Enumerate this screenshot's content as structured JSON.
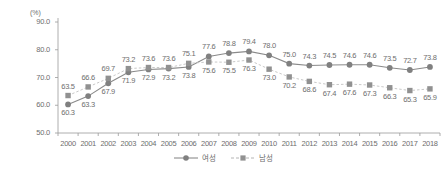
{
  "chart_data": {
    "type": "line",
    "title": "",
    "subtitle": "",
    "xlabel": "",
    "ylabel": "",
    "unit_label": "(%)",
    "ylim": [
      50.0,
      90.0
    ],
    "yticks": [
      "90.0",
      "80.0",
      "70.0",
      "60.0",
      "50.0"
    ],
    "grid": false,
    "legend_position": "bottom-center",
    "categories": [
      "2000",
      "2001",
      "2002",
      "2003",
      "2004",
      "2005",
      "2006",
      "2007",
      "2008",
      "2009",
      "2010",
      "2011",
      "2012",
      "2013",
      "2014",
      "2015",
      "2016",
      "2017",
      "2018"
    ],
    "series": [
      {
        "name": "여성",
        "marker": "circle",
        "line_style": "solid",
        "color": "#808080",
        "values": [
          60.3,
          63.3,
          67.9,
          71.9,
          72.9,
          73.2,
          73.8,
          77.6,
          78.8,
          79.4,
          78.0,
          75.0,
          74.3,
          74.5,
          74.6,
          74.6,
          73.5,
          72.7,
          73.8
        ],
        "labels": [
          "60.3",
          "63.3",
          "67.9",
          "71.9",
          "72.9",
          "73.2",
          "73.8",
          "77.6",
          "78.8",
          "79.4",
          "78.0",
          "75.0",
          "74.3",
          "74.5",
          "74.6",
          "74.6",
          "73.5",
          "72.7",
          "73.8"
        ],
        "label_positions": [
          "below",
          "below",
          "below",
          "below",
          "below",
          "below",
          "below",
          "above",
          "above",
          "above",
          "above",
          "above",
          "above",
          "above",
          "above",
          "above",
          "above",
          "above",
          "above"
        ]
      },
      {
        "name": "남성",
        "marker": "square",
        "line_style": "dashed",
        "color": "#919191",
        "values": [
          63.5,
          66.6,
          69.7,
          73.2,
          73.6,
          73.6,
          75.1,
          75.6,
          75.5,
          76.3,
          73.0,
          70.2,
          68.6,
          67.4,
          67.6,
          67.3,
          66.3,
          65.3,
          65.9
        ],
        "labels": [
          "63.5",
          "66.6",
          "69.7",
          "73.2",
          "73.6",
          "73.6",
          "75.1",
          "75.6",
          "75.5",
          "76.3",
          "73.0",
          "70.2",
          "68.6",
          "67.4",
          "67.6",
          "67.3",
          "66.3",
          "65.3",
          "65.9"
        ],
        "label_positions": [
          "above",
          "above",
          "above",
          "above",
          "above",
          "above",
          "above",
          "below",
          "below",
          "below",
          "below",
          "below",
          "below",
          "below",
          "below",
          "below",
          "below",
          "below",
          "below"
        ]
      }
    ]
  },
  "colors": {
    "axis": "#9a9a9a",
    "text": "#6e6e6e",
    "series_female": "#808080",
    "series_male": "#919191"
  }
}
